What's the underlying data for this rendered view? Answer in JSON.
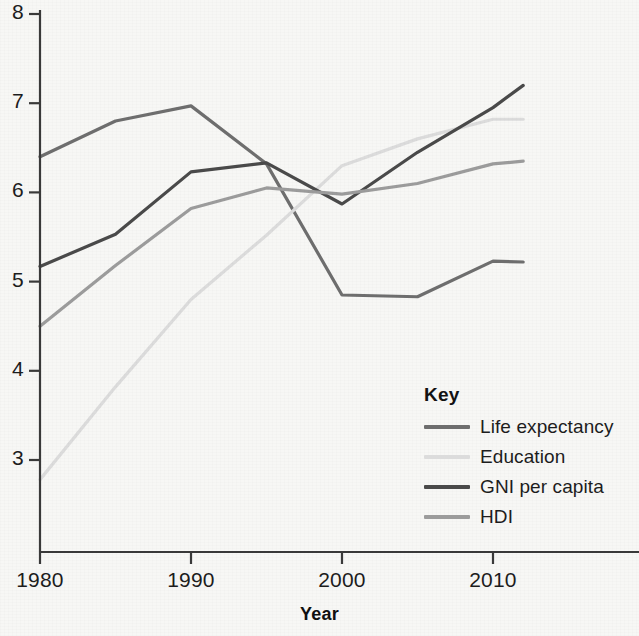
{
  "chart_data": {
    "type": "line",
    "title": "",
    "xlabel": "Year",
    "ylabel": "",
    "xlim": [
      1980,
      2012
    ],
    "ylim": [
      3,
      8
    ],
    "xticks": [
      1980,
      1990,
      2000,
      2010
    ],
    "yticks": [
      3,
      4,
      5,
      6,
      7,
      8
    ],
    "xtick_labels": [
      "1980",
      "1990",
      "2000",
      "2010"
    ],
    "ytick_labels": [
      "3",
      "4",
      "5",
      "6",
      "7",
      "8"
    ],
    "grid": false,
    "legend_position": "lower-right-inside",
    "legend_title": "Key",
    "x": [
      1980,
      1985,
      1990,
      1995,
      2000,
      2005,
      2010,
      2012
    ],
    "series": [
      {
        "name": "Life expectancy",
        "color": "#6e6e6e",
        "values": [
          6.4,
          6.8,
          6.97,
          6.32,
          4.85,
          4.83,
          5.23,
          5.22
        ]
      },
      {
        "name": "Education",
        "color": "#dcdcdc",
        "values": [
          2.78,
          3.82,
          4.8,
          5.52,
          6.3,
          6.6,
          6.82,
          6.82
        ]
      },
      {
        "name": "GNI per capita",
        "color": "#4a4a4a",
        "values": [
          5.17,
          5.53,
          6.23,
          6.33,
          5.87,
          6.45,
          6.95,
          7.2
        ]
      },
      {
        "name": "HDI",
        "color": "#9c9c9c",
        "values": [
          4.5,
          5.18,
          5.82,
          6.05,
          5.98,
          6.1,
          6.32,
          6.35
        ]
      }
    ]
  },
  "axis": {
    "x_title": "Year"
  },
  "legend": {
    "title": "Key",
    "entries": [
      {
        "label": "Life expectancy",
        "color": "#6e6e6e"
      },
      {
        "label": "Education",
        "color": "#dcdcdc"
      },
      {
        "label": "GNI per capita",
        "color": "#4a4a4a"
      },
      {
        "label": "HDI",
        "color": "#9c9c9c"
      }
    ]
  },
  "colors": {
    "background": "#f7f7f5",
    "axis": "#3a3a3a",
    "text": "#1d1d1d"
  }
}
